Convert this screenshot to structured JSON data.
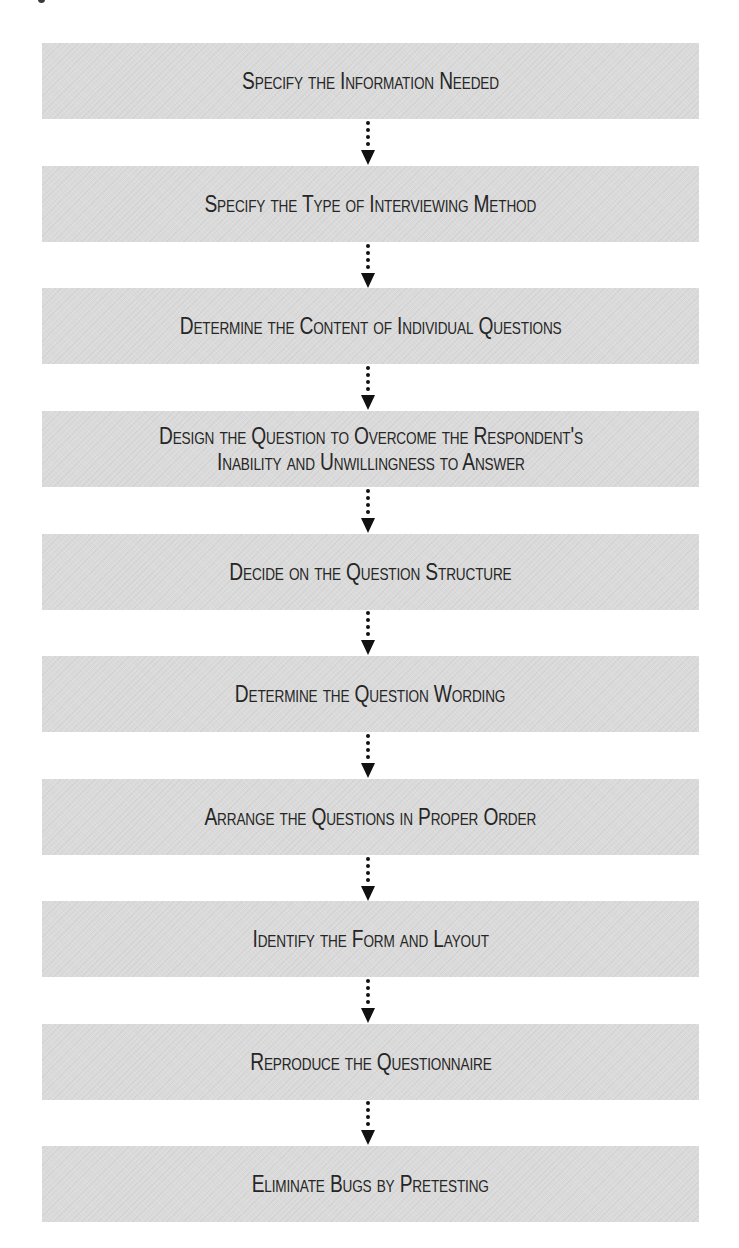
{
  "diagram": {
    "type": "flowchart",
    "direction": "top-to-bottom",
    "box_color": "#dadada",
    "text_color": "#262626",
    "arrow_color": "#111111",
    "steps": [
      {
        "label": "Specify the Information Needed",
        "lines": [
          "Specify the Information Needed"
        ]
      },
      {
        "label": "Specify the Type of Interviewing Method",
        "lines": [
          "Specify the Type of Interviewing Method"
        ]
      },
      {
        "label": "Determine the Content of Individual Questions",
        "lines": [
          "Determine the Content of Individual Questions"
        ]
      },
      {
        "label": "Design the Question to Overcome the Respondent's Inability and Unwillingness to Answer",
        "lines": [
          "Design the Question to Overcome the Respondent's",
          "Inability and Unwillingness to Answer"
        ]
      },
      {
        "label": "Decide on the Question Structure",
        "lines": [
          "Decide on the Question Structure"
        ]
      },
      {
        "label": "Determine the Question Wording",
        "lines": [
          "Determine the Question Wording"
        ]
      },
      {
        "label": "Arrange the Questions in Proper Order",
        "lines": [
          "Arrange the Questions in Proper Order"
        ]
      },
      {
        "label": "Identify the Form and Layout",
        "lines": [
          "Identify the Form and Layout"
        ]
      },
      {
        "label": "Reproduce the Questionnaire",
        "lines": [
          "Reproduce the Questionnaire"
        ]
      },
      {
        "label": "Eliminate Bugs by Pretesting",
        "lines": [
          "Eliminate Bugs by Pretesting"
        ]
      }
    ],
    "connectors": [
      {
        "from": 0,
        "to": 1,
        "style": "dotted-arrow"
      },
      {
        "from": 1,
        "to": 2,
        "style": "dotted-arrow"
      },
      {
        "from": 2,
        "to": 3,
        "style": "dotted-arrow"
      },
      {
        "from": 3,
        "to": 4,
        "style": "dotted-arrow"
      },
      {
        "from": 4,
        "to": 5,
        "style": "dotted-arrow"
      },
      {
        "from": 5,
        "to": 6,
        "style": "dotted-arrow"
      },
      {
        "from": 6,
        "to": 7,
        "style": "dotted-arrow"
      },
      {
        "from": 7,
        "to": 8,
        "style": "dotted-arrow"
      },
      {
        "from": 8,
        "to": 9,
        "style": "dotted-arrow"
      }
    ]
  }
}
